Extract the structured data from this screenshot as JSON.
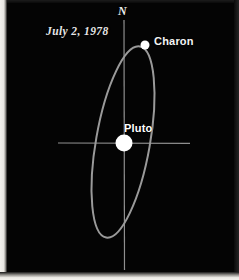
{
  "figure": {
    "background_color": "#040404",
    "width": 239,
    "height": 280
  },
  "annotations": {
    "north_label": "N",
    "date_label": "July 2, 1978",
    "charon_label": "Charon",
    "pluto_label": "Pluto"
  },
  "colors": {
    "background": "#040404",
    "orbit_stroke": "#9a9a9a",
    "axis_stroke": "#8f8f8f",
    "body_fill": "#ffffff",
    "text": "#f0f0f0"
  },
  "chart_data": {
    "type": "scatter",
    "title": "",
    "subtitle": "July 2, 1978",
    "xlabel": "",
    "ylabel": "",
    "grid": false,
    "legend_position": "none",
    "axes": {
      "vertical_axis": {
        "label": "N",
        "x": 124,
        "y_start": 20,
        "y_end": 270,
        "stroke": "#8f8f8f",
        "stroke_width": 1.1
      },
      "horizontal_axis": {
        "label": "",
        "y": 143,
        "x_start": 58,
        "x_end": 190,
        "stroke": "#8f8f8f",
        "stroke_width": 1.1
      }
    },
    "orbit": {
      "name": "Charon orbit around Pluto",
      "shape": "ellipse",
      "center_x": 123,
      "center_y": 142,
      "semi_major": 97,
      "semi_minor": 27,
      "rotation_deg": 10,
      "stroke": "#9a9a9a",
      "stroke_width": 2,
      "fill": "none",
      "extremes": {
        "top_x": 125,
        "top_y": 45,
        "bottom_x": 104,
        "bottom_y": 238,
        "left_crossing_x": 98,
        "right_crossing_x": 148
      }
    },
    "bodies": [
      {
        "name": "Pluto",
        "label": "Pluto",
        "x": 124,
        "y": 143,
        "radius": 8.5,
        "fill": "#ffffff"
      },
      {
        "name": "Charon",
        "label": "Charon",
        "x": 145,
        "y": 45,
        "radius": 4.5,
        "fill": "#ffffff"
      }
    ]
  }
}
